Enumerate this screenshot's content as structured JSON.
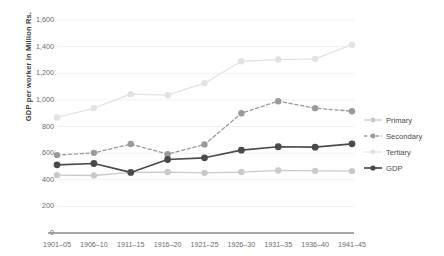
{
  "chart_data": {
    "type": "line",
    "title": "",
    "xlabel": "",
    "ylabel": "GDP per worker  in Million Rs.",
    "ylim": [
      0,
      1600
    ],
    "ytick_step": 200,
    "grid": true,
    "legend_position": "right",
    "categories": [
      "1901–05",
      "1906–10",
      "1911–15",
      "1916–20",
      "1921–25",
      "1926–30",
      "1931–35",
      "1936–40",
      "1941–45"
    ],
    "ytick_labels": [
      "0",
      "200",
      "400",
      "600",
      "800",
      "1,000",
      "1,200",
      "1,400",
      "1,600"
    ],
    "ytick_values": [
      0,
      200,
      400,
      600,
      800,
      1000,
      1200,
      1400,
      1600
    ],
    "series": [
      {
        "name": "Primary",
        "color": "#c9c9c9",
        "style": "solid",
        "values": [
          435,
          432,
          455,
          458,
          452,
          458,
          470,
          467,
          465
        ]
      },
      {
        "name": "Secondary",
        "color": "#9a9a9a",
        "style": "dashed",
        "values": [
          585,
          602,
          668,
          592,
          665,
          900,
          990,
          938,
          915
        ]
      },
      {
        "name": "Tertiary",
        "color": "#e2e2e2",
        "style": "solid",
        "values": [
          868,
          938,
          1043,
          1035,
          1125,
          1290,
          1303,
          1308,
          1415
        ]
      },
      {
        "name": "GDP",
        "color": "#4a4a4a",
        "style": "solid",
        "values": [
          512,
          522,
          455,
          552,
          565,
          622,
          648,
          645,
          670
        ]
      }
    ]
  },
  "legend": {
    "items": [
      {
        "label": "Primary"
      },
      {
        "label": "Secondary"
      },
      {
        "label": "Tertiary"
      },
      {
        "label": "GDP"
      }
    ]
  },
  "colors": {
    "axis": "#8a8a8a",
    "grid": "#f0f0f0",
    "tick_text": "#6b6b6b",
    "axis_title": "#3a3a3a"
  }
}
